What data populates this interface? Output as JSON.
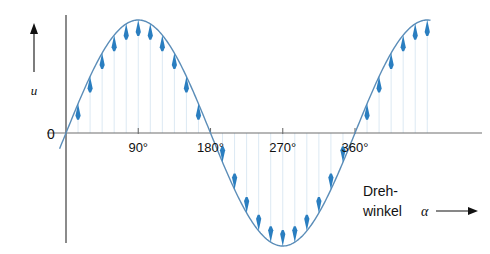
{
  "figure": {
    "title": "",
    "background": "#ffffff",
    "axis_color": "#6e6e6e",
    "curve_color": "#5b8db8",
    "arrow_color": "#2a7ec0",
    "gridline_color": "#dce9f3",
    "y_axis_label": "u",
    "zero_label": "0",
    "annotation_line1": "Dreh-",
    "annotation_line2": "winkel",
    "annotation_symbol": "α"
  },
  "chart_data": {
    "type": "line",
    "title": "",
    "xlabel": "Drehwinkel α",
    "ylabel": "u",
    "xlim": [
      -15,
      465
    ],
    "ylim": [
      -1.15,
      1.15
    ],
    "grid": false,
    "legend": null,
    "x_tick_values": [
      90,
      180,
      270,
      360
    ],
    "x_tick_labels": [
      "90°",
      "180°",
      "270°",
      "360°"
    ],
    "y_tick_values": [
      0
    ],
    "y_tick_labels": [
      "0"
    ],
    "series": [
      {
        "name": "u = û · sin α",
        "type": "sine",
        "amplitude": 1,
        "period_deg": 360,
        "phase_deg": 0,
        "x_start_deg": -8,
        "x_end_deg": 455
      }
    ],
    "annotations": [
      {
        "text": "Dreh-winkel α",
        "x": 395,
        "y": -0.62,
        "arrow": "right"
      }
    ],
    "vector_samples": {
      "description": "Instantaneous value arrows drawn from the zero axis to the sine curve every 15 degrees",
      "step_deg": 15,
      "angles_deg": [
        15,
        30,
        45,
        60,
        75,
        90,
        105,
        120,
        135,
        150,
        165,
        195,
        210,
        225,
        240,
        255,
        270,
        285,
        300,
        315,
        330,
        345,
        375,
        390,
        405,
        420,
        435,
        450
      ],
      "values": [
        0.259,
        0.5,
        0.707,
        0.866,
        0.966,
        1.0,
        0.966,
        0.866,
        0.707,
        0.5,
        0.259,
        -0.259,
        -0.5,
        -0.707,
        -0.866,
        -0.966,
        -1.0,
        -0.966,
        -0.866,
        -0.707,
        -0.5,
        -0.259,
        0.259,
        0.5,
        0.707,
        0.866,
        0.966,
        1.0
      ]
    }
  }
}
